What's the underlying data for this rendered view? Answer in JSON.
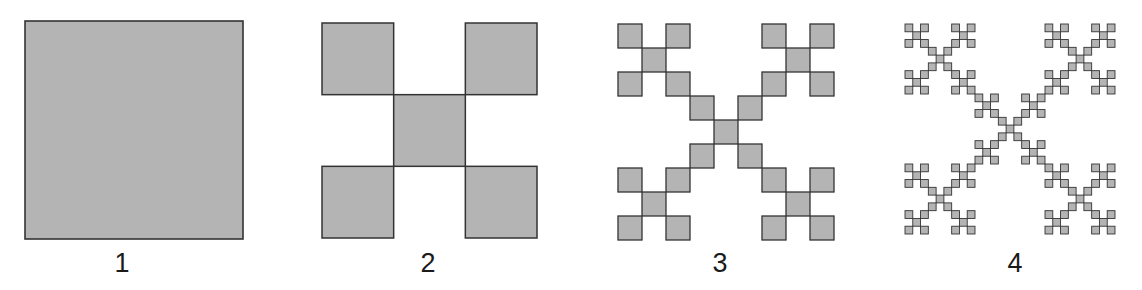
{
  "diagram": {
    "colors": {
      "fill": "#b4b4b4",
      "stroke": "#333333",
      "background": "#ffffff"
    },
    "figures": [
      {
        "label": "1",
        "iteration": 0,
        "x": 25,
        "y": 21,
        "size": 218,
        "label_cx": 122,
        "label_y": 250,
        "stroke_width": 1.6
      },
      {
        "label": "2",
        "iteration": 1,
        "x": 322,
        "y": 23,
        "size": 215,
        "label_cx": 428,
        "label_y": 250,
        "stroke_width": 1.5
      },
      {
        "label": "3",
        "iteration": 2,
        "x": 618,
        "y": 24,
        "size": 216,
        "label_cx": 720,
        "label_y": 250,
        "stroke_width": 1.3
      },
      {
        "label": "4",
        "iteration": 3,
        "x": 905,
        "y": 24,
        "size": 210,
        "label_cx": 1015,
        "label_y": 250,
        "stroke_width": 0.9
      }
    ]
  }
}
